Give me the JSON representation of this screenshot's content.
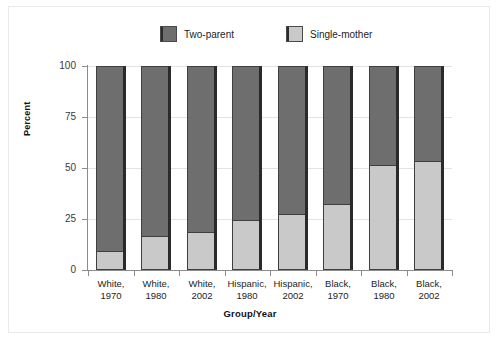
{
  "chart_data": {
    "type": "bar",
    "subtype": "stacked-bar-100",
    "title": "",
    "xlabel": "Group/Year",
    "ylabel": "Percent",
    "ylim": [
      0,
      100
    ],
    "yticks": [
      0,
      25,
      50,
      75,
      100
    ],
    "grid": true,
    "legend_position": "top-center",
    "categories": [
      "White,\n1970",
      "White,\n1980",
      "White,\n2002",
      "Hispanic,\n1980",
      "Hispanic,\n2002",
      "Black,\n1970",
      "Black,\n1980",
      "Black,\n2002"
    ],
    "category_lines": [
      [
        "White,",
        "1970"
      ],
      [
        "White,",
        "1980"
      ],
      [
        "White,",
        "2002"
      ],
      [
        "Hispanic,",
        "1980"
      ],
      [
        "Hispanic,",
        "2002"
      ],
      [
        "Black,",
        "1970"
      ],
      [
        "Black,",
        "1980"
      ],
      [
        "Black,",
        "2002"
      ]
    ],
    "series": [
      {
        "name": "Single-mother",
        "color": "#c9c9c9",
        "values": [
          9,
          16,
          18,
          24,
          27,
          32,
          51,
          53
        ]
      },
      {
        "name": "Two-parent",
        "color": "#6e6e6e",
        "values": [
          91,
          84,
          82,
          76,
          73,
          68,
          49,
          47
        ]
      }
    ]
  },
  "legend": {
    "items": [
      {
        "label": "Two-parent",
        "color": "#6e6e6e",
        "swatch": "dark"
      },
      {
        "label": "Single-mother",
        "color": "#c9c9c9",
        "swatch": "light"
      }
    ]
  },
  "axes": {
    "y": {
      "title": "Percent",
      "ticks": [
        "100",
        "75",
        "50",
        "25",
        "0"
      ]
    },
    "x": {
      "title": "Group/Year"
    }
  }
}
